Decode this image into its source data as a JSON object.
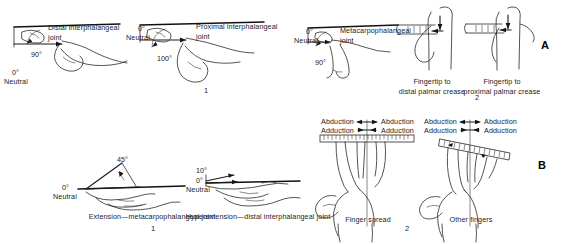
{
  "figure": {
    "type": "medical-line-illustration"
  },
  "panels": [
    {
      "id": "A",
      "letter": "A",
      "subpanels": [
        {
          "number": "1",
          "items": [
            {
              "name": "distal-interphalangeal-flexion",
              "caption_line1": "Distal interphalangeal",
              "caption_line2": "joint",
              "angle": "90°",
              "neutral_angle": "0°",
              "neutral_label": "Neutral"
            },
            {
              "name": "proximal-interphalangeal-flexion",
              "caption_line1": "Proximal interphalangeal",
              "caption_line2": "joint",
              "angle": "100°",
              "neutral_angle": "0°",
              "neutral_label": "Neutral"
            },
            {
              "name": "metacarpophalangeal-flexion",
              "caption_line1": "Metacarpophalangeal",
              "caption_line2": "joint",
              "angle": "90°",
              "neutral_angle": "0°",
              "neutral_label": "Neutral"
            }
          ]
        },
        {
          "number": "2",
          "items": [
            {
              "name": "fingertip-to-distal-palmar-crease",
              "caption_line1": "Fingertip to",
              "caption_line2": "distal palmar crease"
            },
            {
              "name": "fingertip-to-proximal-palmar-crease",
              "caption_line1": "Fingertip to",
              "caption_line2": "proximal palmar crease"
            }
          ]
        }
      ]
    },
    {
      "id": "B",
      "letter": "B",
      "subpanels": [
        {
          "number": "1",
          "items": [
            {
              "name": "extension-metacarpophalangeal-joint",
              "caption": "Extension—metacarpophalangeal joint",
              "angle": "45°",
              "neutral_angle": "0°",
              "neutral_label": "Neutral"
            },
            {
              "name": "hyperextension-distal-interphalangeal-joint",
              "caption": "Hyperextension—distal interphalangeal joint",
              "angle": "10°",
              "neutral_angle": "0°",
              "neutral_label": "Neutral"
            }
          ]
        },
        {
          "number": "2",
          "items": [
            {
              "name": "finger-spread",
              "caption": "Finger spread",
              "labels": {
                "abduction_left": "Abduction",
                "abduction_right": "Abduction",
                "adduction_left": "Adduction",
                "adduction_right": "Adduction"
              }
            },
            {
              "name": "other-fingers",
              "caption": "Other fingers",
              "labels": {
                "abduction_left": "Abduction",
                "abduction_right": "Abduction",
                "adduction_left": "Adduction",
                "adduction_right": "Adduction"
              }
            }
          ]
        }
      ]
    }
  ],
  "colors": {
    "ink": "#2a2a2a",
    "background": "#ffffff",
    "text": "#1c1c1c"
  }
}
